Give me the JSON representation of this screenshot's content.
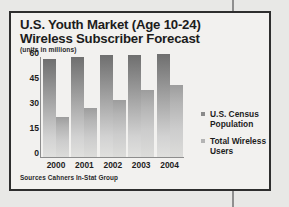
{
  "figure": {
    "title_line1": "U.S. Youth Market (Age 10-24)",
    "title_line2": "Wireless Subscriber Forecast",
    "subtitle": "(units in millions)",
    "source": "Sources Cahners In-Stat Group"
  },
  "legend": {
    "position": "right",
    "items": [
      {
        "label_line1": "U.S. Census",
        "label_line2": "Population",
        "color": "#8a8a8a"
      },
      {
        "label_line1": "Total Wireless",
        "label_line2": "Users",
        "color": "#b4b4b4"
      }
    ]
  },
  "chart_data": {
    "type": "bar",
    "title": "U.S. Youth Market (Age 10-24) Wireless Subscriber Forecast",
    "subtitle": "(units in millions)",
    "xlabel": "",
    "ylabel": "units in millions",
    "ylim": [
      0,
      60
    ],
    "yticks": [
      0,
      15,
      30,
      45,
      60
    ],
    "ytick_labels": [
      "0",
      "15",
      "30",
      "45",
      "60"
    ],
    "grid": false,
    "categories": [
      "2000",
      "2001",
      "2002",
      "2003",
      "2004"
    ],
    "series": [
      {
        "name": "U.S. Census Population",
        "values": [
          59,
          60,
          61,
          61,
          62
        ],
        "color": "#8a8a8a"
      },
      {
        "name": "Total Wireless Users",
        "values": [
          24,
          29.5,
          34.5,
          40,
          43.5
        ],
        "color": "#b4b4b4"
      }
    ],
    "source": "Sources Cahners In-Stat Group"
  }
}
